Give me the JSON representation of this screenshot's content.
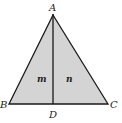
{
  "diagram": {
    "type": "triangle",
    "fill_color": "#d4d4d4",
    "stroke_color": "#1a1a1a",
    "vertices": {
      "A": {
        "label": "A",
        "x": 53,
        "y": 15
      },
      "B": {
        "label": "B",
        "x": 9,
        "y": 104
      },
      "C": {
        "label": "C",
        "x": 108,
        "y": 104
      },
      "D": {
        "label": "D",
        "x": 53,
        "y": 104
      }
    },
    "segments": [
      "AB",
      "AC",
      "BC",
      "AD"
    ],
    "regions": [
      {
        "label": "m",
        "x": 40,
        "y": 82
      },
      {
        "label": "n",
        "x": 69,
        "y": 82
      }
    ]
  }
}
